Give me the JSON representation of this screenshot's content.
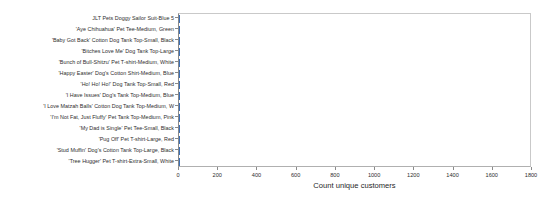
{
  "chart_data": {
    "type": "bar",
    "orientation": "horizontal",
    "title": "",
    "subtitle": "",
    "xlabel": "Count unique customers",
    "ylabel": "",
    "xlim": [
      0,
      1800
    ],
    "ylim": null,
    "grid": false,
    "legend": null,
    "xticks": [
      0,
      200,
      400,
      600,
      800,
      1000,
      1200,
      1400,
      1600,
      1800
    ],
    "xtick_labels": [
      "0",
      "200",
      "400",
      "600",
      "800",
      "1000",
      "1200",
      "1400",
      "1600",
      "1800"
    ],
    "categories": [
      "JLT Pets Doggy Sailor Suit-Blue 5",
      "'Aye Chihuahua' Pet Tee-Medium, Green",
      "'Baby Got Back' Cotton Dog Tank Top-Small, Black",
      "'Bitches Love Me' Dog Tank Top-Large",
      "'Bunch of Bull-Shitzu' Pet T-shirt-Medium, White",
      "'Happy Easter' Dog's Cotton Shirt-Medium, Blue",
      "'Ho! Ho! Ho!' Dog Tank Top-Small, Red",
      "'I Have Issues' Dog's Tank Top-Medium, Blue",
      "'I Love Matzah Balls' Cotton Dog Tank Top-Medium, W",
      "'I'm Not Fat, Just Fluffy' Pet Tank Top-Medium, Pink",
      "'My Dad is Single' Pet Tee-Small, Black",
      "'Pug Off' Pet T-shirt-Large, Red",
      "'Stud Muffin' Dog's Cotton Tank Top-Large, Black",
      "'Tree Hugger' Pet T-shirt-Extra-Small, White"
    ],
    "values": [
      1,
      1,
      1,
      1,
      1,
      1,
      1,
      1,
      1,
      1,
      1,
      1,
      1,
      1
    ],
    "bar_color": "#3b6fb6"
  },
  "axis": {
    "x_title": "Count unique customers"
  }
}
